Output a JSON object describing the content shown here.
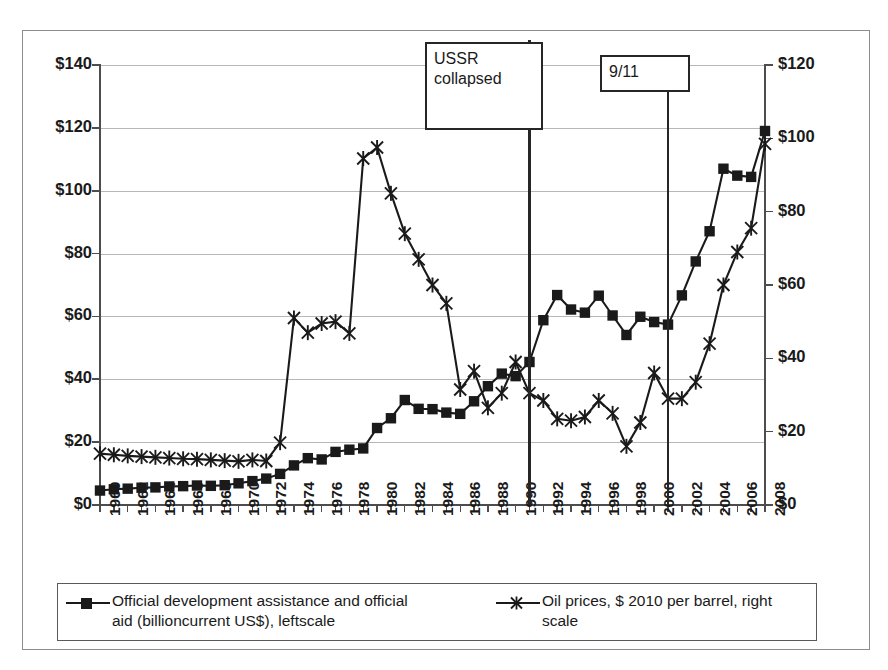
{
  "chart_data": {
    "type": "line",
    "title": "",
    "xlabel": "",
    "ylabel_left": "$",
    "ylabel_right": "$",
    "grid": true,
    "legend_position": "bottom",
    "x": [
      1960,
      1961,
      1962,
      1963,
      1964,
      1965,
      1966,
      1967,
      1968,
      1969,
      1970,
      1971,
      1972,
      1973,
      1974,
      1975,
      1976,
      1977,
      1978,
      1979,
      1980,
      1981,
      1982,
      1983,
      1984,
      1985,
      1986,
      1987,
      1988,
      1989,
      1990,
      1991,
      1992,
      1993,
      1994,
      1995,
      1996,
      1997,
      1998,
      1999,
      2000,
      2001,
      2002,
      2003,
      2004,
      2005,
      2006,
      2007,
      2008
    ],
    "xtick_labels": [
      "1960",
      "1962",
      "1964",
      "1966",
      "1968",
      "1970",
      "1972",
      "1974",
      "1976",
      "1978",
      "1980",
      "1982",
      "1984",
      "1986",
      "1988",
      "1990",
      "1992",
      "1994",
      "1996",
      "1998",
      "2000",
      "2002",
      "2004",
      "2006",
      "2008"
    ],
    "ylim_left": [
      0,
      140
    ],
    "ytick_labels_left": [
      "$0",
      "$20",
      "$40",
      "$60",
      "$80",
      "$100",
      "$120",
      "$140"
    ],
    "ylim_right": [
      0,
      120
    ],
    "ytick_labels_right": [
      "$0",
      "$20",
      "$40",
      "$60",
      "$80",
      "$100",
      "$120"
    ],
    "series": [
      {
        "name": "Official development assistance and official aid (billioncurrent US$), leftscale",
        "axis": "left",
        "marker": "square",
        "color": "#1a1a1a",
        "values": [
          4.6,
          5.0,
          5.2,
          5.5,
          5.6,
          5.9,
          6.0,
          6.2,
          6.1,
          6.3,
          6.9,
          7.6,
          8.4,
          9.9,
          12.6,
          14.9,
          14.5,
          16.9,
          17.6,
          18.0,
          24.5,
          27.6,
          33.4,
          30.6,
          30.5,
          29.4,
          29.0,
          33.0,
          37.8,
          41.8,
          41.0,
          45.5,
          58.8,
          66.8,
          62.2,
          61.2,
          66.6,
          60.3,
          54.1,
          59.9,
          58.2,
          57.4,
          66.7,
          77.5,
          87.1,
          107.0,
          104.8,
          104.4,
          119.0
        ]
      },
      {
        "name": "Oil prices, $ 2010 per barrel, right scale",
        "axis": "right",
        "marker": "star",
        "color": "#1a1a1a",
        "values": [
          14.0,
          13.7,
          13.4,
          13.2,
          13.0,
          12.8,
          12.6,
          12.5,
          12.3,
          12.1,
          11.9,
          12.3,
          12.0,
          17.0,
          51.0,
          47.0,
          49.5,
          50.0,
          46.8,
          94.5,
          97.5,
          85.0,
          74.0,
          67.0,
          60.0,
          55.0,
          31.5,
          36.5,
          26.5,
          30.5,
          39.0,
          30.5,
          28.5,
          23.5,
          23.0,
          24.0,
          28.5,
          25.0,
          16.0,
          22.5,
          36.0,
          29.0,
          29.0,
          33.5,
          44.0,
          60.0,
          69.0,
          75.5,
          98.5
        ]
      }
    ],
    "annotations": [
      {
        "id": "ussr",
        "label": "USSR\ncollapsed",
        "label_line1": "USSR",
        "label_line2": "collapsed",
        "x_year": 1991
      },
      {
        "id": "nine-eleven",
        "label": "9/11",
        "label_line1": "9/11",
        "x_year": 2001
      }
    ]
  },
  "legend": {
    "items": [
      {
        "label_line1": "Official development assistance and official",
        "label_line2": "aid (billioncurrent US$), leftscale",
        "marker": "square"
      },
      {
        "label_line1": "Oil prices, $ 2010 per barrel, right",
        "label_line2": "scale",
        "marker": "star"
      }
    ]
  }
}
